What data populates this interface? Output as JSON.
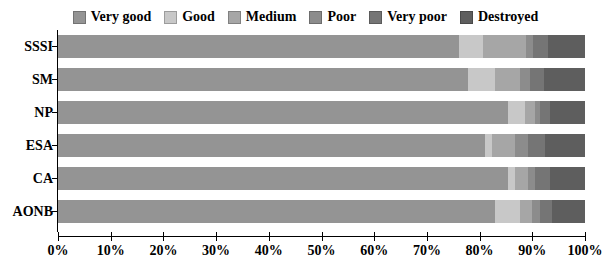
{
  "chart_data": {
    "type": "bar",
    "orientation": "horizontal",
    "stacked": true,
    "normalized": true,
    "title": "",
    "xlabel": "",
    "ylabel": "",
    "xlim": [
      0,
      100
    ],
    "xtick_labels": [
      "0%",
      "10%",
      "20%",
      "30%",
      "40%",
      "50%",
      "60%",
      "70%",
      "80%",
      "90%",
      "100%"
    ],
    "xtick_values": [
      0,
      10,
      20,
      30,
      40,
      50,
      60,
      70,
      80,
      90,
      100
    ],
    "grid": false,
    "legend_position": "top",
    "categories": [
      "SSSI",
      "SM",
      "NP",
      "ESA",
      "CA",
      "AONB"
    ],
    "series": [
      {
        "name": "Very good",
        "color": "#949494",
        "values": [
          76.0,
          77.8,
          85.4,
          81.0,
          85.4,
          83.0
        ]
      },
      {
        "name": "Good",
        "color": "#c8c8c8",
        "values": [
          4.6,
          5.1,
          3.2,
          1.3,
          1.3,
          4.7
        ]
      },
      {
        "name": "Medium",
        "color": "#a6a6a6",
        "values": [
          8.3,
          4.7,
          1.9,
          4.4,
          2.5,
          2.3
        ]
      },
      {
        "name": "Poor",
        "color": "#8c8c8c",
        "values": [
          1.3,
          1.9,
          0.9,
          2.5,
          1.3,
          1.5
        ]
      },
      {
        "name": "Very poor",
        "color": "#757575",
        "values": [
          2.7,
          2.8,
          1.9,
          3.2,
          2.8,
          2.3
        ]
      },
      {
        "name": "Destroyed",
        "color": "#5e5e5e",
        "values": [
          7.1,
          7.7,
          6.7,
          7.6,
          6.7,
          6.2
        ]
      }
    ]
  },
  "legend": {
    "items": [
      {
        "label": "Very good"
      },
      {
        "label": "Good"
      },
      {
        "label": "Medium"
      },
      {
        "label": "Poor"
      },
      {
        "label": "Very poor"
      },
      {
        "label": "Destroyed"
      }
    ]
  },
  "axis": {
    "y_labels": [
      "SSSI",
      "SM",
      "NP",
      "ESA",
      "CA",
      "AONB"
    ],
    "x_labels": [
      "0%",
      "10%",
      "20%",
      "30%",
      "40%",
      "50%",
      "60%",
      "70%",
      "80%",
      "90%",
      "100%"
    ]
  }
}
